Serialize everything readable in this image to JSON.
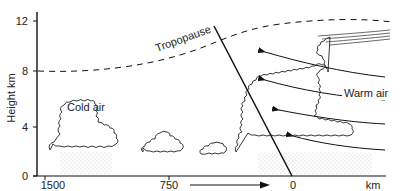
{
  "diagram": {
    "type": "cold-front cross-section",
    "y_axis": {
      "label": "Height km",
      "ticks": [
        "0",
        "4",
        "8",
        "12"
      ]
    },
    "x_axis": {
      "ticks": [
        "1500",
        "750",
        "0"
      ],
      "unit": "km"
    },
    "labels": {
      "tropopause": "Tropopause",
      "cold_air": "Cold air",
      "warm_air": "Warm air"
    },
    "colors": {
      "line": "#111111",
      "cloud_outline": "#222222",
      "rain_stipple": "#9a9a9a"
    }
  }
}
